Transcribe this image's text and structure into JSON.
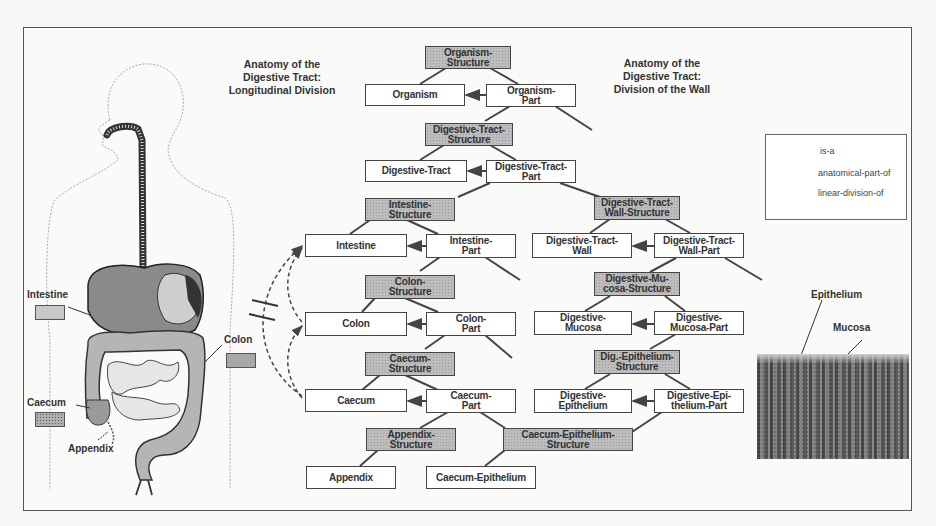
{
  "figure": {
    "titles": {
      "left": "Anatomy of the\nDigestive Tract:\nLongitudinal Division",
      "right": "Anatomy of the\nDigestive Tract:\nDivision of the Wall"
    },
    "nodes": {
      "organism_structure": "Organism-\nStructure",
      "organism": "Organism",
      "organism_part": "Organism-\nPart",
      "dt_structure": "Digestive-Tract-\nStructure",
      "dt": "Digestive-Tract",
      "dt_part": "Digestive-Tract-\nPart",
      "intestine_structure": "Intestine-\nStructure",
      "intestine": "Intestine",
      "intestine_part": "Intestine-\nPart",
      "dtw_structure": "Digestive-Tract-\nWall-Structure",
      "dtw": "Digestive-Tract-\nWall",
      "dtw_part": "Digestive-Tract-\nWall-Part",
      "colon_structure": "Colon-\nStructure",
      "colon": "Colon",
      "colon_part": "Colon-\nPart",
      "dm_structure": "Digestive-Mu-\ncosa-Structure",
      "dm": "Digestive-\nMucosa",
      "dm_part": "Digestive-\nMucosa-Part",
      "caecum_structure": "Caecum-\nStructure",
      "caecum": "Caecum",
      "caecum_part": "Caecum-\nPart",
      "de_structure": "Dig.-Epithelium-\nStructure",
      "de": "Digestive-\nEpithelium",
      "de_part": "Digestive-Epi-\nthelium-Part",
      "appendix_structure": "Appendix-\nStructure",
      "appendix": "Appendix",
      "ce_structure": "Caecum-Epithelium-\nStructure",
      "ce": "Caecum-Epithelium"
    },
    "legend": {
      "items": [
        {
          "label": "is-a",
          "style": "solid-line"
        },
        {
          "label": "anatomical-part-of",
          "style": "solid-arrow"
        },
        {
          "label": "linear-division-of",
          "style": "dashed-arrow"
        }
      ]
    },
    "anatomy_labels": {
      "intestine": "Intestine",
      "colon": "Colon",
      "caecum": "Caecum",
      "appendix": "Appendix"
    },
    "micrograph_labels": {
      "epithelium": "Epithelium",
      "mucosa": "Mucosa"
    },
    "colors": {
      "structure_fill": "#bdbdbd",
      "part_fill": "#ffffff",
      "line": "#444444"
    }
  }
}
